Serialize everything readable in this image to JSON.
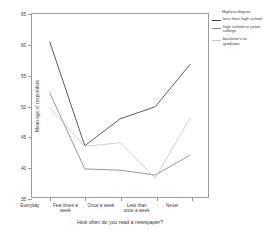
{
  "chart_data": {
    "type": "line",
    "title": "",
    "xlabel": "How often do you read a newspaper?",
    "ylabel": "Mean age of respondent",
    "categories": [
      "Everyday",
      "Few times a week",
      "Once a week",
      "Less than once a week",
      "Never"
    ],
    "category_lines": [
      [
        "Everyday"
      ],
      [
        "Few times a",
        "week"
      ],
      [
        "Once a week"
      ],
      [
        "Less than",
        "once a week"
      ],
      [
        "Never"
      ]
    ],
    "ylim": [
      35,
      65
    ],
    "yticks": [
      65,
      60,
      55,
      50,
      45,
      40,
      35
    ],
    "grid": false,
    "legend_position": "right",
    "legend_title": "Highest degree",
    "series": [
      {
        "name": "less than high school",
        "name_lines": [
          "less than high school"
        ],
        "color": "#4a4a4a",
        "values": [
          60.5,
          43.4,
          47.8,
          49.8,
          56.8
        ]
      },
      {
        "name": "high school or junior college",
        "name_lines": [
          "high school or junior",
          "college"
        ],
        "color": "#8c8c8c",
        "values": [
          52.1,
          39.6,
          39.4,
          38.6,
          41.9
        ]
      },
      {
        "name": "bachelor's or graduate",
        "name_lines": [
          "bachelor's or",
          "graduate"
        ],
        "color": "#c9c9c9",
        "values": [
          49.6,
          43.3,
          43.9,
          38.1,
          48.0
        ]
      }
    ]
  }
}
